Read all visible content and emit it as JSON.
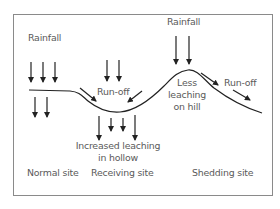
{
  "diagram": {
    "type": "soil leaching by topographic position",
    "colors": {
      "line": "#222222",
      "frame": "#888888",
      "text": "#5a5a5a",
      "background": "#ffffff"
    },
    "labels": {
      "rainfall_left": "Rainfall",
      "rainfall_hill": "Rainfall",
      "runoff_hollow": "Run-off",
      "runoff_hill": "Run-off",
      "less_leaching_line1": "Less",
      "less_leaching_line2": "leaching",
      "less_leaching_line3": "on hill",
      "increased_leaching_line1": "Increased leaching",
      "increased_leaching_line2": "in hollow"
    },
    "sites": [
      {
        "id": "normal",
        "label": "Normal site"
      },
      {
        "id": "receiving",
        "label": "Receiving site"
      },
      {
        "id": "shedding",
        "label": "Shedding site"
      }
    ],
    "arrows": {
      "rain_normal": 3,
      "leach_normal": 2,
      "rain_receiving": 2,
      "runoff_into_hollow": 2,
      "leach_hollow": 4,
      "rain_hill": 2,
      "runoff_off_hill": 2
    }
  }
}
